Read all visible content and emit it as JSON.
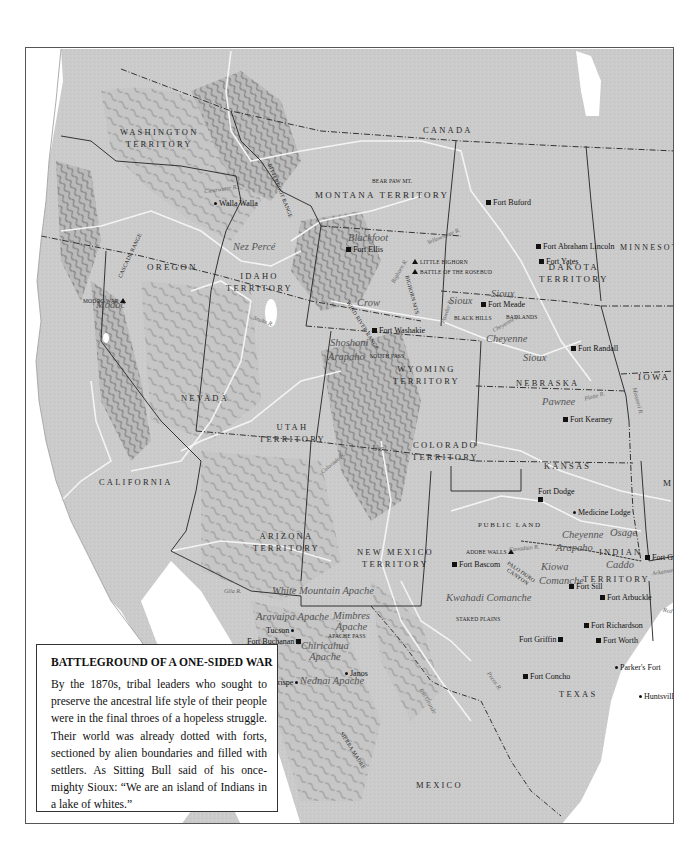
{
  "caption": {
    "title": "BATTLEGROUND OF A ONE-SIDED WAR",
    "body": "By the 1870s, tribal leaders who sought to preserve the ancestral life style of their people were in the final throes of a hopeless struggle. Their world was already dotted with forts, sectioned by alien boundaries and filled with settlers. As Sitting Bull said of his once-mighty Sioux: “We are an island of Indians in a lake of whites.”"
  },
  "colors": {
    "land": "#c8c8c8",
    "water": "#ffffff",
    "border": "#333333",
    "river": "#f2f2f2",
    "relief": "#8a8a8a"
  },
  "regions": {
    "canada": "CANADA",
    "washington": [
      "WASHINGTON",
      "TERRITORY"
    ],
    "montana": "MONTANA TERRITORY",
    "dakota": [
      "DAKOTA",
      "TERRITORY"
    ],
    "minnesota": "MINNESOTA",
    "oregon": "OREGON",
    "idaho": [
      "IDAHO",
      "TERRITORY"
    ],
    "wyoming": [
      "WYOMING",
      "TERRITORY"
    ],
    "iowa": "IOWA",
    "nebraska": "NEBRASKA",
    "nevada": "NEVADA",
    "utah": [
      "UTAH",
      "TERRITORY"
    ],
    "colorado": [
      "COLORADO",
      "TERRITORY"
    ],
    "kansas": "KANSAS",
    "mo": "MO",
    "california": "CALIFORNIA",
    "arizona": [
      "ARIZONA",
      "TERRITORY"
    ],
    "new_mexico": [
      "NEW MEXICO",
      "TERRITORY"
    ],
    "public_land": "PUBLIC LAND",
    "indian_territory": [
      "INDIAN",
      "TERRITORY"
    ],
    "texas": "TEXAS",
    "mexico": "MEXICO"
  },
  "tribes": {
    "nez_perce": "Nez Percé",
    "modoc": "Modoc",
    "blackfoot": "Blackfoot",
    "crow": "Crow",
    "sioux_1": "Sioux",
    "sioux_2": "Sioux",
    "sioux_3": "Sioux",
    "cheyenne_1": "Cheyenne",
    "shoshoni": "Shoshoni",
    "arapaho_1": "Arapaho",
    "pawnee": "Pawnee",
    "ute": "Ute",
    "cheyenne_2": "Cheyenne",
    "arapaho_2": "Arapaho",
    "osage": "Osage",
    "caddo": "Caddo",
    "kiowa": "Kiowa",
    "comanche": "Comanche",
    "kwahadi": "Kwahadi Comanche",
    "white_mountain": "White Mountain Apache",
    "aravaipa": "Aravaipa Apache",
    "mimbres": [
      "Mimbres",
      "Apache"
    ],
    "chiricahua": [
      "Chiricahua",
      "Apache"
    ],
    "nednai": "Nednai Apache"
  },
  "forts": {
    "walla_walla": "Walla Walla",
    "fort_buford": "Fort Buford",
    "fort_abraham_lincoln": "Fort Abraham Lincoln",
    "fort_yates": "Fort Yates",
    "fort_ellis": "Fort Ellis",
    "fort_meade": "Fort Meade",
    "fort_washakie": "Fort Washakie",
    "fort_randall": "Fort Randall",
    "fort_kearney": "Fort Kearney",
    "fort_dodge": "Fort Dodge",
    "medicine_lodge": "Medicine Lodge",
    "fort_bascom": "Fort Bascom",
    "fort_gibson": "Fort Gibson",
    "fort_sill": "Fort Sill",
    "fort_arbuckle": "Fort Arbuckle",
    "fort_richardson": "Fort Richardson",
    "fort_griffin": "Fort Griffin",
    "fort_worth": "Fort Worth",
    "fort_concho": "Fort Concho",
    "parkers_fort": "Parker's Fort",
    "huntsville": "Huntsville",
    "tucson": "Tucson",
    "fort_buchanan": "Fort Buchanan",
    "janos": "Janos",
    "arispe": "Arispe"
  },
  "battles": {
    "modoc_war": "MODOC WAR",
    "little_bighorn": "LITTLE BIGHORN",
    "rosebud": "BATTLE OF THE ROSEBUD",
    "adobe_walls": "ADOBE WALLS"
  },
  "features": {
    "bear_paw": "BEAR PAW MT.",
    "black_hills": "BLACK HILLS",
    "badlands": "BADLANDS",
    "south_pass": "SOUTH PASS",
    "apache_pass": "APACHE PASS",
    "staked_plains": "STAKED PLAINS",
    "palo_duro": [
      "PALO DURO",
      "CANYON"
    ],
    "cascade_range": "CASCADE RANGE",
    "bitterroot_range": "BITTERROOT RANGE",
    "wind_river_range": "WIND RIVER RANGE",
    "bighorn_mts": "BIGHORN MTS.",
    "sierra_madre": "SIERRA MADRE"
  },
  "rivers": {
    "clearwater": "Clearwater R.",
    "yellowstone": "Yellowstone R.",
    "snake": "Snake R.",
    "powder": "Powder R.",
    "bighorn": "Bighorn R.",
    "cheyenne": "Cheyenne R.",
    "platte": "Platte R.",
    "missouri": "Missouri R.",
    "colorado": "Colorado R.",
    "gila": "Gila R.",
    "canadian": "Canadian R.",
    "arkansas": "Arkansas R.",
    "red": "Red R.",
    "pecos": "Pecos R.",
    "rio_grande": "Rio Grande",
    "col_r": "Col. R."
  }
}
